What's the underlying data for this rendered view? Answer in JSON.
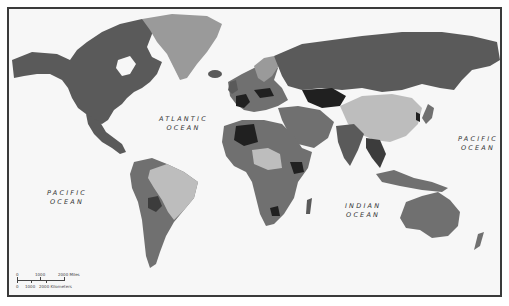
{
  "map": {
    "type": "choropleth-world-map",
    "style": "grayscale",
    "colors": {
      "ocean": "#f7f7f7",
      "frame": "#3a3a3a",
      "shade_light": "#bdbdbd",
      "shade_mid_light": "#9a9a9a",
      "shade_mid": "#707070",
      "shade_mid_dark": "#5a5a5a",
      "shade_dark": "#3c3c3c",
      "shade_darkest": "#202020"
    }
  },
  "ocean_labels": {
    "atlantic": {
      "line1": "ATLANTIC",
      "line2": "OCEAN"
    },
    "pacific_west": {
      "line1": "PACIFIC",
      "line2": "OCEAN"
    },
    "indian": {
      "line1": "INDIAN",
      "line2": "OCEAN"
    },
    "pacific_east": {
      "line1": "PACIFIC",
      "line2": "OCEAN"
    }
  },
  "scale_bar": {
    "miles": {
      "t0": "0",
      "t1": "1000",
      "t2": "2000 Miles"
    },
    "kilometers": {
      "t0": "0",
      "t1": "1000",
      "t2": "2000 Kilometers"
    }
  }
}
